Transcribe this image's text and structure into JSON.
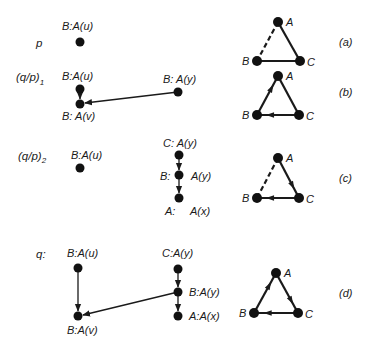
{
  "rows": [
    {
      "id": "p",
      "label": "p",
      "panel": "(a)",
      "nodes": [
        {
          "id": "u",
          "label": "B:A(u)"
        }
      ],
      "edges": [],
      "triangle": {
        "vertices": [
          "A",
          "B",
          "C"
        ],
        "edges": [
          {
            "from": "A",
            "to": "B",
            "style": "dashed",
            "directed": false
          },
          {
            "from": "A",
            "to": "C",
            "style": "solid",
            "directed": false
          },
          {
            "from": "B",
            "to": "C",
            "style": "solid",
            "directed": false
          }
        ]
      }
    },
    {
      "id": "qp1",
      "label": "(q/p)",
      "subscript": "1",
      "panel": "(b)",
      "nodes": [
        {
          "id": "u",
          "label": "B:A(u)"
        },
        {
          "id": "v",
          "label": "B: A(v)"
        },
        {
          "id": "y",
          "label": "B: A(y)"
        }
      ],
      "edges": [
        {
          "from": "u",
          "to": "v"
        },
        {
          "from": "y",
          "to": "v"
        }
      ],
      "triangle": {
        "vertices": [
          "A",
          "B",
          "C"
        ],
        "edges": [
          {
            "from": "B",
            "to": "A",
            "style": "solid",
            "directed": true
          },
          {
            "from": "A",
            "to": "C",
            "style": "solid",
            "directed": false
          },
          {
            "from": "C",
            "to": "B",
            "style": "solid",
            "directed": true
          }
        ]
      }
    },
    {
      "id": "qp2",
      "label": "(q/p)",
      "subscript": "2",
      "panel": "(c)",
      "nodes": [
        {
          "id": "u",
          "label": "B:A(u)"
        },
        {
          "id": "cy",
          "label": "C: A(y)"
        },
        {
          "id": "by",
          "label_left": "B:",
          "label_right": "A(y)"
        },
        {
          "id": "ax",
          "label_left": "A:",
          "label_right": "A(x)"
        }
      ],
      "edges": [
        {
          "from": "cy",
          "to": "by"
        },
        {
          "from": "by",
          "to": "ax"
        }
      ],
      "triangle": {
        "vertices": [
          "A",
          "B",
          "C"
        ],
        "edges": [
          {
            "from": "A",
            "to": "B",
            "style": "dashed",
            "directed": false
          },
          {
            "from": "A",
            "to": "C",
            "style": "solid",
            "directed": true
          },
          {
            "from": "C",
            "to": "B",
            "style": "solid",
            "directed": true
          }
        ]
      }
    },
    {
      "id": "q",
      "label": "q:",
      "panel": "(d)",
      "nodes": [
        {
          "id": "u",
          "label": "B:A(u)"
        },
        {
          "id": "v",
          "label": "B:A(v)"
        },
        {
          "id": "cy",
          "label": "C:A(y)"
        },
        {
          "id": "by",
          "label": "B:A(y)"
        },
        {
          "id": "ax",
          "label": "A:A(x)"
        }
      ],
      "edges": [
        {
          "from": "u",
          "to": "v"
        },
        {
          "from": "cy",
          "to": "by"
        },
        {
          "from": "by",
          "to": "ax"
        },
        {
          "from": "by",
          "to": "v"
        }
      ],
      "triangle": {
        "vertices": [
          "A",
          "B",
          "C"
        ],
        "edges": [
          {
            "from": "B",
            "to": "A",
            "style": "solid",
            "directed": true
          },
          {
            "from": "A",
            "to": "C",
            "style": "solid",
            "directed": true
          },
          {
            "from": "C",
            "to": "B",
            "style": "solid",
            "directed": true
          }
        ]
      }
    }
  ]
}
